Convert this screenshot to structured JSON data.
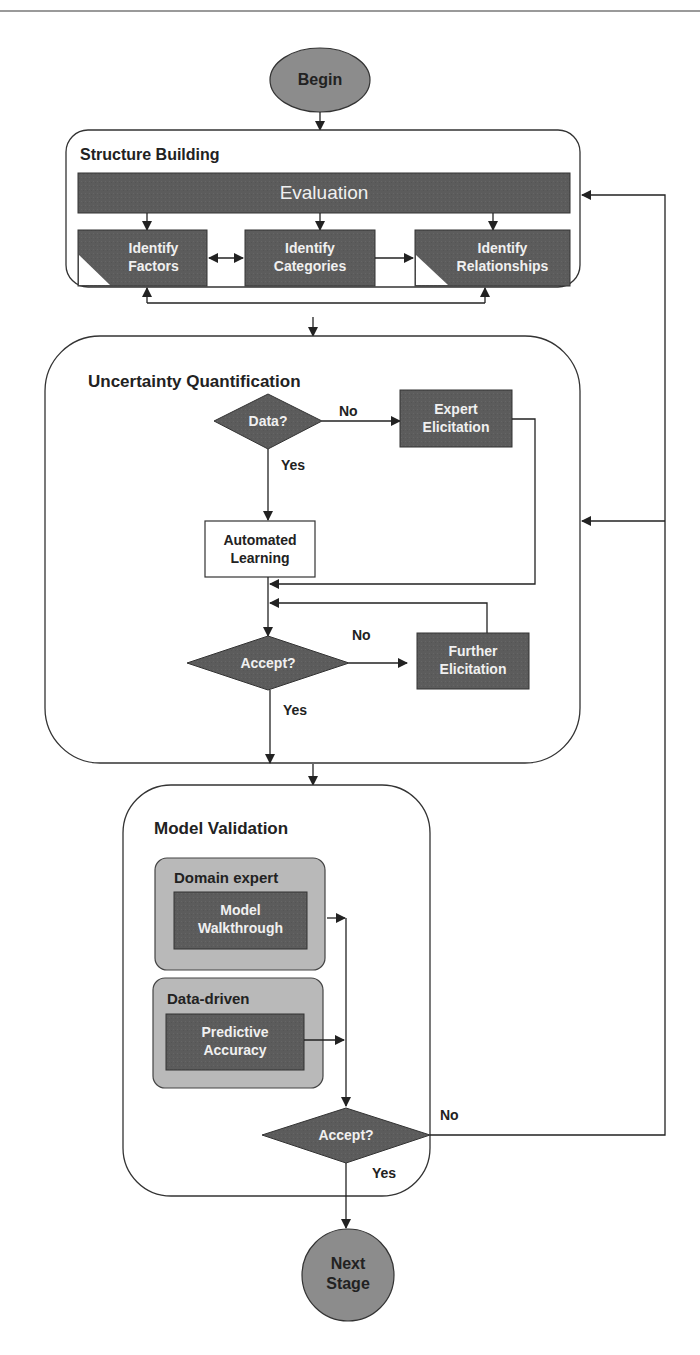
{
  "colors": {
    "dark_box": "#5a5a5a",
    "ellipse": "#8c8c8c",
    "light_container": "#b8b8b8",
    "line": "#222222",
    "container_border": "#333333"
  },
  "terminals": {
    "begin": "Begin",
    "end_line1": "Next",
    "end_line2": "Stage"
  },
  "structure_building": {
    "title": "Structure Building",
    "evaluation": "Evaluation",
    "factors_line1": "Identify",
    "factors_line2": "Factors",
    "categories_line1": "Identify",
    "categories_line2": "Categories",
    "relationships_line1": "Identify",
    "relationships_line2": "Relationships"
  },
  "uncertainty_quantification": {
    "title": "Uncertainty Quantification",
    "data_decision": "Data?",
    "no_label": "No",
    "yes_label": "Yes",
    "expert_line1": "Expert",
    "expert_line2": "Elicitation",
    "automated_line1": "Automated",
    "automated_line2": "Learning",
    "accept_decision": "Accept?",
    "accept_no_label": "No",
    "accept_yes_label": "Yes",
    "further_line1": "Further",
    "further_line2": "Elicitation"
  },
  "model_validation": {
    "title": "Model Validation",
    "domain_expert_title": "Domain expert",
    "walkthrough_line1": "Model",
    "walkthrough_line2": "Walkthrough",
    "data_driven_title": "Data-driven",
    "predictive_line1": "Predictive",
    "predictive_line2": "Accuracy",
    "accept_decision": "Accept?",
    "no_label": "No",
    "yes_label": "Yes"
  }
}
